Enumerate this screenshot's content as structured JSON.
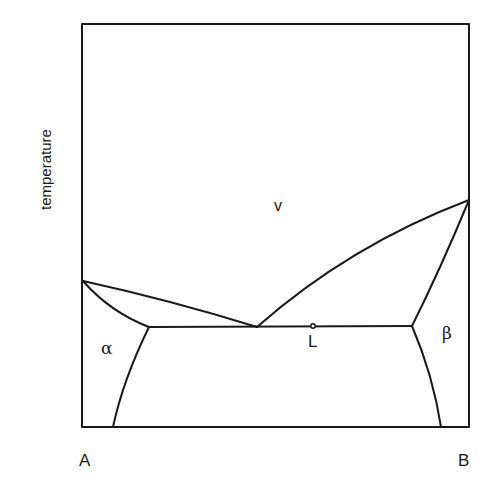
{
  "diagram": {
    "type": "binary phase diagram",
    "axis": {
      "y_label": "temperature",
      "x_left_label": "A",
      "x_right_label": "B"
    },
    "regions": {
      "vapor": "v",
      "liquid": "L",
      "alpha": "α",
      "beta": "β"
    },
    "colors": {
      "line": "#1a1a1a",
      "background": "#ffffff"
    }
  }
}
